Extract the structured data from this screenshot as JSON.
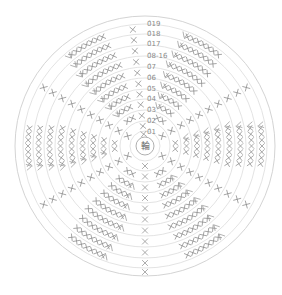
{
  "diagram": {
    "type": "crochet-round-chart",
    "center": {
      "x": 145,
      "y": 146
    },
    "center_label": "輪",
    "center_radius": 9,
    "ring_radii": [
      15,
      25,
      36,
      47,
      57,
      68,
      79,
      90,
      101,
      112,
      122,
      130
    ],
    "colors": {
      "background": "#ffffff",
      "ring": "#dcdcdc",
      "stitch": "#8a8a8a"
    },
    "round_labels": [
      {
        "text": "0̂1",
        "x": 147,
        "y": 134
      },
      {
        "text": "0̂2",
        "x": 147,
        "y": 123
      },
      {
        "text": "0̂3",
        "x": 147,
        "y": 112
      },
      {
        "text": "0̂4",
        "x": 147,
        "y": 101
      },
      {
        "text": "0̂5",
        "x": 147,
        "y": 91
      },
      {
        "text": "0̂6",
        "x": 147,
        "y": 80
      },
      {
        "text": "0̂7",
        "x": 147,
        "y": 69
      },
      {
        "text": "0̂8-16",
        "x": 147,
        "y": 58
      },
      {
        "text": "0̂17",
        "x": 147,
        "y": 46
      },
      {
        "text": "0̂18",
        "x": 147,
        "y": 36
      },
      {
        "text": "0̂19",
        "x": 147,
        "y": 26
      }
    ],
    "spokes": [
      {
        "name": "up",
        "angle": -96,
        "from": 1,
        "to": 11
      },
      {
        "name": "up-right",
        "angle": -30,
        "from": 2,
        "to": 11
      },
      {
        "name": "down-right",
        "angle": 30,
        "from": 2,
        "to": 11
      },
      {
        "name": "down",
        "angle": 90,
        "from": 2,
        "to": 12
      },
      {
        "name": "down-left",
        "angle": 150,
        "from": 2,
        "to": 11
      },
      {
        "name": "up-left",
        "angle": 210,
        "from": 2,
        "to": 11
      }
    ],
    "fans": [
      {
        "name": "fan-upper-left",
        "angle": -120,
        "from": 3,
        "to": 11
      },
      {
        "name": "fan-upper-right",
        "angle": -60,
        "from": 3,
        "to": 11
      },
      {
        "name": "fan-right",
        "angle": 0,
        "from": 3,
        "to": 11
      },
      {
        "name": "fan-lower-right",
        "angle": 60,
        "from": 3,
        "to": 11
      },
      {
        "name": "fan-lower-left",
        "angle": 120,
        "from": 3,
        "to": 11
      },
      {
        "name": "fan-left",
        "angle": 180,
        "from": 3,
        "to": 11
      }
    ],
    "symbols": {
      "single_crochet": "X",
      "increase": "V",
      "chain_ring": "輪"
    }
  }
}
